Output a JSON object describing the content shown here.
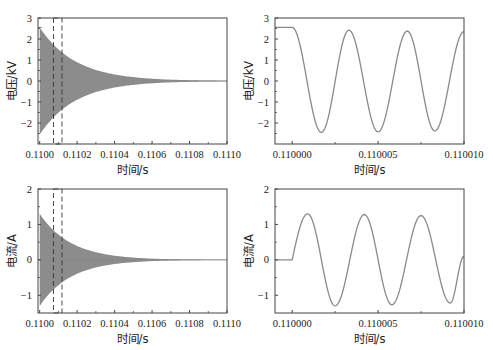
{
  "chart_data": [
    {
      "id": "voltage-overview",
      "type": "line",
      "title": "",
      "xlabel": "时间/s",
      "ylabel": "电压/kV",
      "xlim": [
        0.109991,
        0.111
      ],
      "ylim": [
        -3,
        3
      ],
      "xticks": [
        0.11,
        0.1102,
        0.1104,
        0.1106,
        0.1108,
        0.111
      ],
      "xtick_labels": [
        "0.1100",
        "0.1102",
        "0.1104",
        "0.1106",
        "0.1108",
        "0.1110"
      ],
      "yticks": [
        3,
        2,
        1,
        0,
        -1,
        -2
      ],
      "ytick_labels": [
        "3",
        "2",
        "1",
        "0",
        "−1",
        "−2"
      ],
      "grid": false,
      "series": [
        {
          "name": "voltage",
          "description": "pre-step constant 2.55 kV until t=0.1100, then high-frequency oscillation with exponentially decaying envelope (~2.55 kV initial) approaching 0 by ~0.1108",
          "initial_value": 2.55,
          "step_time": 0.11,
          "envelope_peak": 2.55,
          "decay_end": 0.1108
        }
      ],
      "annotations": [
        {
          "type": "dashed-box",
          "x": [
            0.10999,
            0.11001
          ],
          "note": "zoom region"
        }
      ]
    },
    {
      "id": "voltage-zoom",
      "type": "line",
      "xlabel": "时间/s",
      "ylabel": "电压/kV",
      "xlim": [
        0.109999,
        0.11001
      ],
      "ylim": [
        -3,
        3
      ],
      "xticks": [
        0.11,
        0.110005,
        0.11001
      ],
      "xtick_labels": [
        "0.110000",
        "0.110005",
        "0.110010"
      ],
      "yticks": [
        3,
        2,
        1,
        0,
        -1,
        -2
      ],
      "ytick_labels": [
        "3",
        "2",
        "1",
        "0",
        "−1",
        "−2"
      ],
      "grid": false,
      "series": [
        {
          "name": "voltage",
          "x": [
            0.109999,
            0.11,
            0.1100017,
            0.1100033,
            0.110005,
            0.1100067,
            0.1100083,
            0.11001
          ],
          "values": [
            2.55,
            2.55,
            -2.45,
            2.42,
            -2.42,
            2.38,
            -2.38,
            2.35
          ]
        }
      ]
    },
    {
      "id": "current-overview",
      "type": "line",
      "xlabel": "时间/s",
      "ylabel": "电流/A",
      "xlim": [
        0.109991,
        0.111
      ],
      "ylim": [
        -1.5,
        2
      ],
      "xticks": [
        0.11,
        0.1102,
        0.1104,
        0.1106,
        0.1108,
        0.111
      ],
      "xtick_labels": [
        "0.1100",
        "0.1102",
        "0.1104",
        "0.1106",
        "0.1108",
        "0.1110"
      ],
      "yticks": [
        2,
        1,
        0,
        -1
      ],
      "ytick_labels": [
        "2",
        "1",
        "0",
        "−1"
      ],
      "grid": false,
      "series": [
        {
          "name": "current",
          "description": "zero until t=0.1100, then high-frequency oscillation with decaying envelope (~1.3 A initial) approaching 0 by ~0.1107",
          "initial_value": 0,
          "step_time": 0.11,
          "envelope_peak": 1.3,
          "decay_end": 0.1107
        }
      ],
      "annotations": [
        {
          "type": "dashed-box",
          "x": [
            0.10999,
            0.11001
          ],
          "note": "zoom region"
        }
      ]
    },
    {
      "id": "current-zoom",
      "type": "line",
      "xlabel": "时间/s",
      "ylabel": "电流/A",
      "xlim": [
        0.109999,
        0.11001
      ],
      "ylim": [
        -1.5,
        2
      ],
      "xticks": [
        0.11,
        0.110005,
        0.11001
      ],
      "xtick_labels": [
        "0.110000",
        "0.110005",
        "0.110010"
      ],
      "yticks": [
        2,
        1,
        0,
        -1
      ],
      "ytick_labels": [
        "2",
        "1",
        "0",
        "−1"
      ],
      "grid": false,
      "series": [
        {
          "name": "current",
          "x": [
            0.109999,
            0.11,
            0.1100009,
            0.1100025,
            0.1100042,
            0.1100058,
            0.1100075,
            0.1100092,
            0.11001
          ],
          "values": [
            0,
            0,
            1.3,
            -1.3,
            1.28,
            -1.27,
            1.25,
            -1.22,
            0.1
          ]
        }
      ]
    }
  ]
}
